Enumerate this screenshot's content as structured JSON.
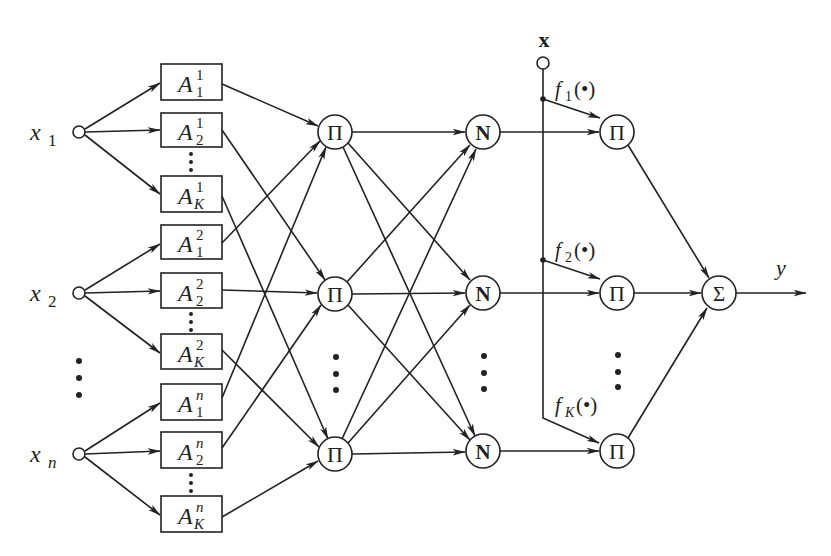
{
  "diagram": {
    "type": "neuro-fuzzy network architecture (TSK / ANFIS-style)",
    "inputs": [
      {
        "var": "x",
        "sub": "1"
      },
      {
        "var": "x",
        "sub": "2"
      },
      {
        "var": "x",
        "sub": "n"
      }
    ],
    "membership_functions": [
      {
        "base": "A",
        "sup": "1",
        "sub": "1"
      },
      {
        "base": "A",
        "sup": "1",
        "sub": "2"
      },
      {
        "base": "A",
        "sup": "1",
        "sub": "K"
      },
      {
        "base": "A",
        "sup": "2",
        "sub": "1"
      },
      {
        "base": "A",
        "sup": "2",
        "sub": "2"
      },
      {
        "base": "A",
        "sup": "2",
        "sub": "K"
      },
      {
        "base": "A",
        "sup": "n",
        "sub": "1"
      },
      {
        "base": "A",
        "sup": "n",
        "sub": "2"
      },
      {
        "base": "A",
        "sup": "n",
        "sub": "K"
      }
    ],
    "rule_layer_symbol": "Π",
    "norm_layer_symbol": "N",
    "consequent_layer_symbol": "Π",
    "sum_symbol": "Σ",
    "vector_input_label": "x",
    "consequent_functions": [
      {
        "f": "f",
        "sub": "1",
        "arg": "(•)"
      },
      {
        "f": "f",
        "sub": "2",
        "arg": "(•)"
      },
      {
        "f": "f",
        "sub": "K",
        "arg": "(•)"
      }
    ],
    "output_label": "y",
    "ellipsis": "⋮",
    "colors": {
      "stroke": "#222222",
      "background": "#ffffff"
    }
  }
}
